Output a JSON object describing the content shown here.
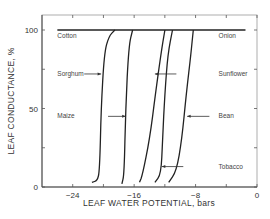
{
  "chart_data": {
    "type": "line",
    "title": "",
    "xlabel": "LEAF WATER POTENTIAL, bars",
    "ylabel": "LEAF CONDUCTANCE, %",
    "xlim": [
      -28,
      0
    ],
    "ylim": [
      0,
      100
    ],
    "x_ticks": [
      -24,
      -20,
      -16,
      -12,
      -8,
      -4,
      0
    ],
    "x_tick_labels": [
      {
        "value": -24,
        "label": "−24"
      },
      {
        "value": -16,
        "label": "−16"
      },
      {
        "value": -8,
        "label": "−8"
      },
      {
        "value": 0,
        "label": "0"
      }
    ],
    "y_ticks": [
      0,
      25,
      50,
      75,
      100
    ],
    "y_tick_labels": [
      {
        "value": 0,
        "label": "0"
      },
      {
        "value": 50,
        "label": "50"
      },
      {
        "value": 100,
        "label": "100"
      }
    ],
    "reference_line": {
      "y": 100,
      "x_range": [
        -26,
        -1.5
      ]
    },
    "series": [
      {
        "name": "Sorghum",
        "points": [
          [
            -21.5,
            3
          ],
          [
            -20.8,
            4
          ],
          [
            -20.5,
            10
          ],
          [
            -20.3,
            50
          ],
          [
            -19.9,
            85
          ],
          [
            -19.3,
            96
          ],
          [
            -18.5,
            100
          ]
        ]
      },
      {
        "name": "Maize",
        "points": [
          [
            -17.6,
            2
          ],
          [
            -17.3,
            8
          ],
          [
            -17.1,
            50
          ],
          [
            -16.7,
            90
          ],
          [
            -16.2,
            100
          ]
        ]
      },
      {
        "name": "Sunflower",
        "points": [
          [
            -15.3,
            3
          ],
          [
            -14.9,
            8
          ],
          [
            -14.0,
            30
          ],
          [
            -13.2,
            60
          ],
          [
            -12.5,
            85
          ],
          [
            -12.0,
            100
          ]
        ]
      },
      {
        "name": "Bean",
        "points": [
          [
            -13.3,
            3
          ],
          [
            -12.5,
            8
          ],
          [
            -12.3,
            30
          ],
          [
            -12.0,
            60
          ],
          [
            -11.6,
            85
          ],
          [
            -11.0,
            100
          ]
        ]
      },
      {
        "name": "Tobacco",
        "points": [
          [
            -11.5,
            3
          ],
          [
            -10.5,
            10
          ],
          [
            -9.8,
            30
          ],
          [
            -9.2,
            60
          ],
          [
            -8.6,
            85
          ],
          [
            -8.3,
            100
          ]
        ]
      }
    ],
    "annotations": [
      {
        "text": "Cotton",
        "x": -26,
        "y": 96,
        "arrow": null
      },
      {
        "text": "Onion",
        "x": -5,
        "y": 96,
        "arrow": null
      },
      {
        "text": "Sorghum",
        "x": -26,
        "y": 72,
        "arrow": {
          "from": [
            -22.5,
            72
          ],
          "to": [
            -20.3,
            72
          ]
        }
      },
      {
        "text": "Sunflower",
        "x": -5,
        "y": 72,
        "arrow": {
          "from": [
            -10.5,
            72
          ],
          "to": [
            -13.3,
            72
          ]
        }
      },
      {
        "text": "Maize",
        "x": -26,
        "y": 45,
        "arrow": {
          "from": [
            -19.4,
            45
          ],
          "to": [
            -17.1,
            45
          ]
        }
      },
      {
        "text": "Bean",
        "x": -5,
        "y": 45,
        "arrow": {
          "from": [
            -6.2,
            45
          ],
          "to": [
            -9.1,
            45
          ]
        }
      },
      {
        "text": "Tobacco",
        "x": -5,
        "y": 13,
        "arrow": {
          "from": [
            -9.6,
            13
          ],
          "to": [
            -12.4,
            13
          ]
        }
      }
    ],
    "grid": false,
    "legend": "none"
  }
}
